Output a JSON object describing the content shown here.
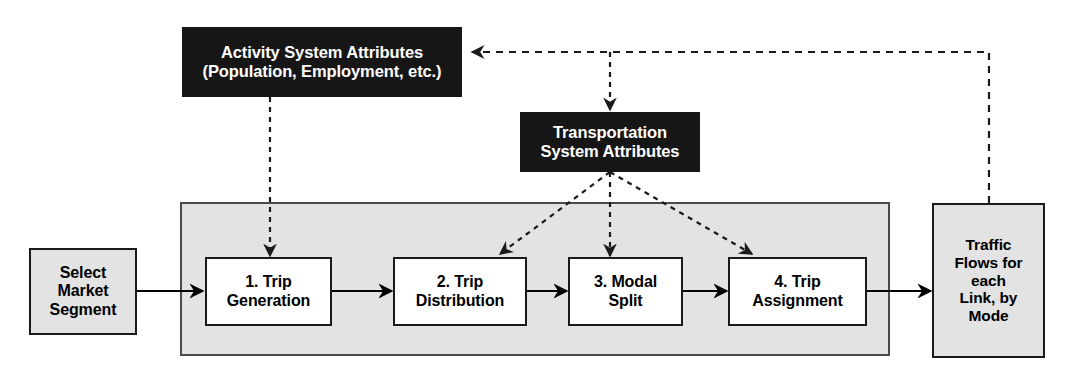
{
  "diagram": {
    "colors": {
      "dark_box_fill": "#161616",
      "dark_box_text": "#ffffff",
      "gray_fill": "#e3e3e3",
      "white_fill": "#ffffff",
      "border": "#1a1a1a",
      "band_border": "#4a4a4a",
      "arrow_solid": "#000000",
      "arrow_dashed": "#333333",
      "page_background": "#ffffff"
    },
    "input": {
      "id": "select-market-segment",
      "label": "Select\nMarket\nSegment",
      "style": "gray"
    },
    "attribute_boxes": [
      {
        "id": "activity-system-attributes",
        "label": "Activity System Attributes\n(Population, Employment, etc.)",
        "style": "dark"
      },
      {
        "id": "transportation-system-attributes",
        "label": "Transportation\nSystem Attributes",
        "style": "dark"
      }
    ],
    "process_steps": [
      {
        "id": "step-1",
        "number": "1.",
        "label": "1. Trip\nGeneration",
        "style": "white"
      },
      {
        "id": "step-2",
        "number": "2.",
        "label": "2. Trip\nDistribution",
        "style": "white"
      },
      {
        "id": "step-3",
        "number": "3.",
        "label": "3. Modal\nSplit",
        "style": "white"
      },
      {
        "id": "step-4",
        "number": "4.",
        "label": "4. Trip\nAssignment",
        "style": "white"
      }
    ],
    "output": {
      "id": "traffic-flows",
      "label": "Traffic\nFlows for\neach\nLink, by\nMode",
      "style": "gray"
    },
    "connections": [
      {
        "from": "select-market-segment",
        "to": "step-1",
        "kind": "solid"
      },
      {
        "from": "step-1",
        "to": "step-2",
        "kind": "solid"
      },
      {
        "from": "step-2",
        "to": "step-3",
        "kind": "solid"
      },
      {
        "from": "step-3",
        "to": "step-4",
        "kind": "solid"
      },
      {
        "from": "step-4",
        "to": "traffic-flows",
        "kind": "solid"
      },
      {
        "from": "activity-system-attributes",
        "to": "step-1",
        "kind": "dashed"
      },
      {
        "from": "transportation-system-attributes",
        "to": "step-2",
        "kind": "dashed"
      },
      {
        "from": "transportation-system-attributes",
        "to": "step-3",
        "kind": "dashed"
      },
      {
        "from": "transportation-system-attributes",
        "to": "step-4",
        "kind": "dashed"
      },
      {
        "from": "traffic-flows",
        "to": "activity-system-attributes",
        "kind": "dashed-feedback"
      },
      {
        "from": "traffic-flows",
        "to": "transportation-system-attributes",
        "kind": "dashed-feedback"
      }
    ]
  }
}
